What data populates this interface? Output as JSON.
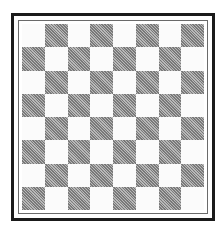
{
  "board": {
    "rows": 8,
    "cols": 8,
    "top_left_square": "light",
    "colors": {
      "light": "#fbfbfb",
      "dark": "#a3a3a3",
      "outer_border": "#1a1a1a",
      "inner_border": "#6a6a6a"
    },
    "squares": [
      [
        "light",
        "dark",
        "light",
        "dark",
        "light",
        "dark",
        "light",
        "dark"
      ],
      [
        "dark",
        "light",
        "dark",
        "light",
        "dark",
        "light",
        "dark",
        "light"
      ],
      [
        "light",
        "dark",
        "light",
        "dark",
        "light",
        "dark",
        "light",
        "dark"
      ],
      [
        "dark",
        "light",
        "dark",
        "light",
        "dark",
        "light",
        "dark",
        "light"
      ],
      [
        "light",
        "dark",
        "light",
        "dark",
        "light",
        "dark",
        "light",
        "dark"
      ],
      [
        "dark",
        "light",
        "dark",
        "light",
        "dark",
        "light",
        "dark",
        "light"
      ],
      [
        "light",
        "dark",
        "light",
        "dark",
        "light",
        "dark",
        "light",
        "dark"
      ],
      [
        "dark",
        "light",
        "dark",
        "light",
        "dark",
        "light",
        "dark",
        "light"
      ]
    ]
  }
}
